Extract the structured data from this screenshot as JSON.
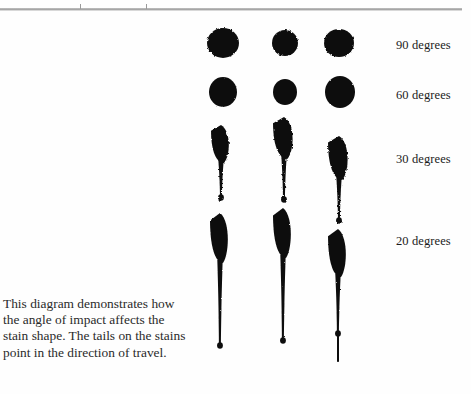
{
  "figure": {
    "type": "diagram",
    "top_rule": {
      "present": true,
      "tick_count": 2
    },
    "caption": {
      "lines": [
        "This diagram demonstrates how",
        "the angle of impact affects the",
        "stain shape. The tails on the stains",
        "point in the direction of travel."
      ],
      "full_text": "This diagram demonstrates how the angle of impact affects the stain shape. The tails on the stains point in the direction of travel."
    },
    "ink_color": "#111111",
    "background_color": "#fefefe",
    "rule_color": "#8d8d8d"
  },
  "rows": [
    {
      "label": "90 degrees",
      "angle": 90,
      "label_x": 396,
      "label_y": 38,
      "stains": [
        {
          "cx": 223,
          "cy": 43,
          "rx": 16,
          "ry": 15,
          "tail": 0,
          "rot": 0
        },
        {
          "cx": 285,
          "cy": 43,
          "rx": 13,
          "ry": 13,
          "tail": 0,
          "rot": 0
        },
        {
          "cx": 339,
          "cy": 43,
          "rx": 15,
          "ry": 14,
          "tail": 0,
          "rot": 0
        }
      ]
    },
    {
      "label": "60 degrees",
      "angle": 60,
      "label_x": 396,
      "label_y": 88,
      "stains": [
        {
          "cx": 223,
          "cy": 92,
          "rx": 14,
          "ry": 15,
          "tail": 0,
          "rot": 0
        },
        {
          "cx": 285,
          "cy": 92,
          "rx": 12,
          "ry": 13,
          "tail": 0,
          "rot": 0
        },
        {
          "cx": 340,
          "cy": 92,
          "rx": 15,
          "ry": 16,
          "tail": 0,
          "rot": 0
        }
      ]
    },
    {
      "label": "30 degrees",
      "angle": 30,
      "label_x": 396,
      "label_y": 152,
      "stains": [
        {
          "cx": 221,
          "cy": 144,
          "rx": 10,
          "ry": 19,
          "tail": 36,
          "rot": 0
        },
        {
          "cx": 284,
          "cy": 138,
          "rx": 11,
          "ry": 21,
          "tail": 42,
          "rot": 0
        },
        {
          "cx": 339,
          "cy": 158,
          "rx": 11,
          "ry": 22,
          "tail": 42,
          "rot": 0
        }
      ]
    },
    {
      "label": "20 degrees",
      "angle": 20,
      "label_x": 396,
      "label_y": 234,
      "stains": [
        {
          "cx": 220,
          "cy": 238,
          "rx": 10,
          "ry": 25,
          "tail": 84,
          "rot": 0
        },
        {
          "cx": 283,
          "cy": 233,
          "rx": 10,
          "ry": 25,
          "tail": 84,
          "rot": 0
        },
        {
          "cx": 338,
          "cy": 253,
          "rx": 10,
          "ry": 24,
          "tail": 58,
          "rot": 0
        }
      ]
    }
  ],
  "extra_marks": [
    {
      "name": "streak-lower-right",
      "x": 338,
      "y": 330,
      "w": 2,
      "h": 32
    }
  ]
}
